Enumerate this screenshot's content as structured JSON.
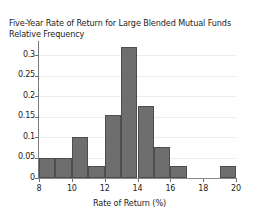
{
  "chart_data": {
    "type": "bar",
    "title": "Five-Year Rate of Return for Large Blended Mutual Funds",
    "subtitle": "Relative Frequency",
    "xlabel": "Rate of Return (%)",
    "ylabel": "Relative Frequency",
    "xlim": [
      8,
      20
    ],
    "ylim": [
      0,
      0.335
    ],
    "grid": true,
    "legend": "none",
    "bin_width": 1,
    "bin_edges": [
      8,
      9,
      10,
      11,
      12,
      13,
      14,
      15,
      16,
      17,
      18,
      19,
      20
    ],
    "categories": [
      "8-9",
      "9-10",
      "10-11",
      "11-12",
      "12-13",
      "13-14",
      "14-15",
      "15-16",
      "16-17",
      "17-18",
      "18-19",
      "19-20"
    ],
    "values": [
      0.05,
      0.05,
      0.1,
      0.03,
      0.155,
      0.32,
      0.175,
      0.075,
      0.03,
      0,
      0,
      0.03
    ],
    "xticks": [
      8,
      10,
      12,
      14,
      16,
      18,
      20
    ],
    "xtick_labels": [
      "8",
      "10",
      "12",
      "14",
      "16",
      "18",
      "20"
    ],
    "yticks": [
      0,
      0.05,
      0.1,
      0.15,
      0.2,
      0.25,
      0.3
    ],
    "ytick_labels": [
      "0",
      "0.05",
      "0.1",
      "0.15",
      "0.2",
      "0.25",
      "0.3"
    ],
    "colors": {
      "bar_fill": "#6e6e6e",
      "bar_edge": "#4d4d4d",
      "grid": "#ececec",
      "axis": "#7a7a7a",
      "text": "#232323",
      "background": "#ffffff"
    }
  }
}
